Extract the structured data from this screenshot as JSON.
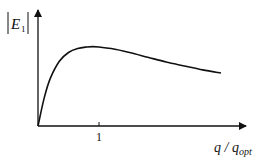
{
  "chart_data": {
    "type": "line",
    "title": "",
    "xlabel": "q / q_opt",
    "ylabel": "|E_1|",
    "ylabel_parts": {
      "base": "E",
      "sub": "1"
    },
    "xlabel_parts": {
      "num": "q",
      "sep": " / ",
      "den": "q",
      "den_sub": "opt"
    },
    "x_ticks": [
      1
    ],
    "x_tick_labels": [
      "1"
    ],
    "grid": false,
    "legend": null,
    "xlim": [
      0,
      3.1
    ],
    "ylim": [
      0,
      1.45
    ],
    "series": [
      {
        "name": "|E_1|",
        "x": [
          0,
          0.1,
          0.2,
          0.35,
          0.5,
          0.65,
          0.8,
          0.9,
          1.0,
          1.2,
          1.5,
          1.8,
          2.1,
          2.4,
          2.7,
          3.0
        ],
        "y": [
          0,
          0.35,
          0.6,
          0.82,
          0.93,
          0.98,
          1.0,
          1.005,
          1.0,
          0.98,
          0.93,
          0.87,
          0.81,
          0.76,
          0.71,
          0.67
        ]
      }
    ]
  }
}
